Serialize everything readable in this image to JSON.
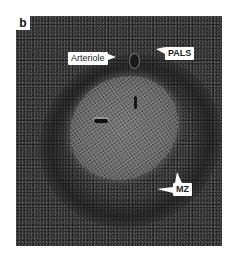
{
  "figure": {
    "panel_label": "b",
    "labels": {
      "arteriole": "Arteriole",
      "pals": "PALS",
      "mz": "MZ"
    }
  }
}
